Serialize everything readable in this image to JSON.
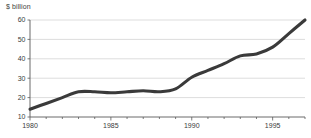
{
  "chart_data": {
    "type": "line",
    "title": "",
    "subtitle": "",
    "xlabel": "",
    "ylabel": "$ billion",
    "ylim": [
      10,
      60
    ],
    "xlim": [
      1980,
      1997
    ],
    "grid": true,
    "legend": false,
    "y_ticks": [
      10,
      20,
      30,
      40,
      50,
      60
    ],
    "y_tick_labels": [
      "10",
      "20",
      "30",
      "40",
      "50",
      "60"
    ],
    "x_ticks": [
      1980,
      1985,
      1990,
      1995
    ],
    "x_tick_labels": [
      "1980",
      "1985",
      "1990",
      "1995"
    ],
    "x_minor_ticks": [
      1981,
      1982,
      1983,
      1984,
      1986,
      1987,
      1988,
      1989,
      1991,
      1992,
      1993,
      1994,
      1996,
      1997
    ],
    "series": [
      {
        "name": "value",
        "color": "#3a3a3a",
        "x": [
          1980,
          1981,
          1982,
          1983,
          1984,
          1985,
          1986,
          1987,
          1988,
          1989,
          1990,
          1991,
          1992,
          1993,
          1994,
          1995,
          1996,
          1997
        ],
        "values": [
          14,
          17,
          20,
          23,
          23,
          22.5,
          23,
          23.5,
          23,
          24.5,
          30.5,
          34,
          37.5,
          41.5,
          42.5,
          46,
          53,
          60
        ]
      }
    ],
    "colors": {
      "line": "#3a3a3a",
      "grid": "#cfcfcf",
      "axis": "#5a5a5a",
      "text": "#3b3b3b",
      "background": "#ffffff"
    },
    "geometry": {
      "plot_left": 30,
      "plot_right": 305,
      "plot_top": 20,
      "plot_bottom": 117
    }
  }
}
